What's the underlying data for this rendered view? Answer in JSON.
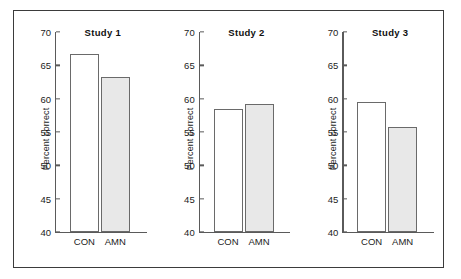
{
  "chart_data": {
    "type": "bar",
    "title": "",
    "xlabel": "",
    "ylabel": "Percent correct",
    "ylim": [
      40,
      70
    ],
    "ytick_step": 5,
    "yticks": [
      70,
      65,
      60,
      55,
      50,
      45,
      40
    ],
    "grid": false,
    "legend": "none",
    "categories": [
      "CON",
      "AMN"
    ],
    "panels": [
      {
        "title": "Study 1",
        "ylabel": "Percent correct",
        "categories": [
          "CON",
          "AMN"
        ],
        "values": [
          66.7,
          63.3
        ]
      },
      {
        "title": "Study 2",
        "ylabel": "Percent correct",
        "categories": [
          "CON",
          "AMN"
        ],
        "values": [
          58.4,
          59.2
        ]
      },
      {
        "title": "Study 3",
        "ylabel": "Percent correct",
        "categories": [
          "CON",
          "AMN"
        ],
        "values": [
          59.5,
          55.7
        ]
      }
    ],
    "series_styles": [
      {
        "name": "CON",
        "fill": "#ffffff",
        "edge": "#6a6a6a"
      },
      {
        "name": "AMN",
        "fill": "#e8e8e8",
        "edge": "#6a6a6a"
      }
    ]
  },
  "figure": {
    "background": "#ffffff",
    "frame_color": "#3b3b3b",
    "axis_color": "#5a5a5a",
    "text_color": "#1c1c1c"
  }
}
